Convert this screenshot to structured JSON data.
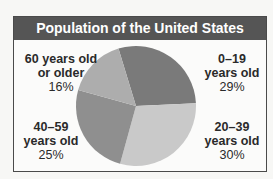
{
  "chart_data": {
    "type": "pie",
    "title": "Population of the United States",
    "categories": [
      "0–19 years old",
      "20–39 years old",
      "40–59 years old",
      "60 years old or older"
    ],
    "values": [
      29,
      30,
      25,
      16
    ],
    "unit": "%",
    "colors": [
      "#7a7a7a",
      "#c9c9c9",
      "#8f8f8f",
      "#adadad"
    ],
    "legend": "none (direct labels)"
  },
  "labels": {
    "s0": {
      "line1": "0–19",
      "line2": "years old",
      "pct": "29%"
    },
    "s1": {
      "line1": "20–39",
      "line2": "years old",
      "pct": "30%"
    },
    "s2": {
      "line1": "40–59",
      "line2": "years old",
      "pct": "25%"
    },
    "s3": {
      "line1": "60 years old",
      "line2": "or older",
      "pct": "16%"
    }
  }
}
